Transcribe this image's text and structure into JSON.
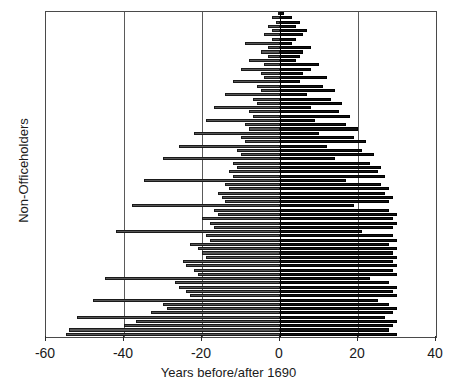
{
  "chart_data": {
    "type": "bar",
    "orientation": "horizontal-diverging",
    "title": "",
    "xlabel": "Years before/after 1690",
    "ylabel": "Non-Officeholders",
    "xlim": [
      -60,
      40
    ],
    "ylim": [
      0,
      76
    ],
    "xticks": [
      -60,
      -40,
      -20,
      0,
      20,
      40
    ],
    "xticklabels": [
      "-60",
      "-40",
      "-20",
      "0",
      "20",
      "40"
    ],
    "grid": "vertical gridlines at each x tick",
    "legend": "none",
    "series": [
      {
        "name": "Years before 1690",
        "color": "#555555",
        "values": [
          -0.5,
          -2,
          -1,
          -3,
          -2,
          -4,
          -2,
          -9,
          -3,
          -5,
          -3,
          -8,
          -4,
          -10,
          -5,
          -4,
          -12,
          -6,
          -5,
          -14,
          -7,
          -6,
          -17,
          -8,
          -7,
          -19,
          -9,
          -8,
          -22,
          -10,
          -9,
          -26,
          -11,
          -10,
          -30,
          -12,
          -11,
          -13,
          -12,
          -35,
          -14,
          -13,
          -16,
          -15,
          -14,
          -38,
          -17,
          -16,
          -20,
          -18,
          -17,
          -42,
          -19,
          -18,
          -23,
          -21,
          -20,
          -19,
          -25,
          -24,
          -22,
          -21,
          -45,
          -27,
          -26,
          -24,
          -23,
          -48,
          -30,
          -29,
          -33,
          -52,
          -37,
          -40,
          -54,
          -55
        ]
      },
      {
        "name": "Years after 1690",
        "color": "#111111",
        "values": [
          1,
          3,
          5,
          4,
          7,
          6,
          4,
          3,
          8,
          6,
          5,
          4,
          10,
          8,
          6,
          12,
          5,
          11,
          14,
          7,
          13,
          16,
          8,
          15,
          18,
          9,
          17,
          20,
          10,
          19,
          22,
          12,
          21,
          24,
          14,
          23,
          26,
          25,
          27,
          17,
          26,
          28,
          27,
          29,
          28,
          19,
          28,
          30,
          29,
          30,
          29,
          21,
          29,
          30,
          28,
          30,
          29,
          30,
          29,
          30,
          29,
          30,
          23,
          28,
          30,
          29,
          30,
          25,
          28,
          30,
          29,
          27,
          30,
          29,
          28,
          30
        ]
      }
    ]
  },
  "axes": {
    "xlabel": "Years before/after 1690",
    "ylabel": "Non-Officeholders"
  }
}
